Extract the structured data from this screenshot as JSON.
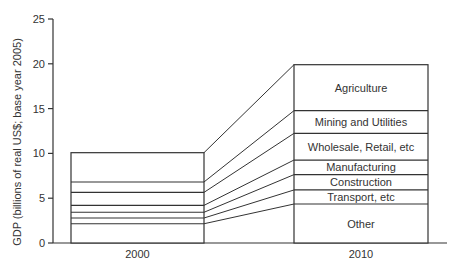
{
  "chart_data": {
    "type": "bar",
    "subtype": "stacked-bar-with-connectors",
    "title": "",
    "xlabel": "",
    "ylabel": "GDP (billions of real US$; base year 2005)",
    "ylim": [
      0,
      25
    ],
    "yticks": [
      0,
      5,
      10,
      15,
      20,
      25
    ],
    "grid": false,
    "legend": "inline labels inside 2010 bar",
    "categories": [
      "2000",
      "2010"
    ],
    "series": [
      {
        "name": "Other",
        "values": [
          2.15,
          4.35
        ]
      },
      {
        "name": "Transport, etc",
        "values": [
          0.64,
          1.57
        ]
      },
      {
        "name": "Construction",
        "values": [
          0.64,
          1.71
        ]
      },
      {
        "name": "Manufacturing",
        "values": [
          0.77,
          1.63
        ]
      },
      {
        "name": "Wholesale, Retail, etc",
        "values": [
          1.45,
          2.98
        ]
      },
      {
        "name": "Mining and Utilities",
        "values": [
          1.16,
          2.53
        ]
      },
      {
        "name": "Agriculture",
        "values": [
          3.27,
          5.13
        ]
      }
    ],
    "cumulative_boundaries": {
      "2000": [
        0,
        2.15,
        2.79,
        3.43,
        4.2,
        5.65,
        6.81,
        10.08
      ],
      "2010": [
        0,
        4.35,
        5.92,
        7.63,
        9.26,
        12.24,
        14.77,
        19.9
      ]
    },
    "totals": {
      "2000": 10.08,
      "2010": 19.9
    }
  },
  "style": {
    "line_color": "#333333",
    "text_color": "#333333",
    "background": "#ffffff"
  }
}
